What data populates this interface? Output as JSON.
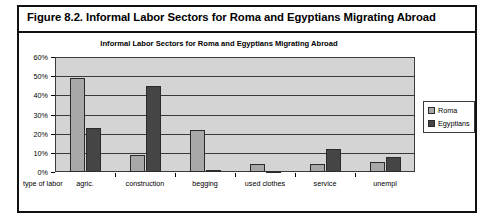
{
  "figure": {
    "caption": "Figure 8.2.  Informal Labor Sectors for Roma and Egyptians Migrating Abroad"
  },
  "chart_data": {
    "type": "bar",
    "title": "Informal Labor Sectors for Roma and Egyptians Migrating Abroad",
    "xlabel": "type of labor",
    "ylabel": "",
    "categories": [
      "agric.",
      "construction",
      "begging",
      "used clothes",
      "service",
      "unempl"
    ],
    "series": [
      {
        "name": "Roma",
        "color": "#a8a8a8",
        "values": [
          49,
          9,
          22,
          4,
          4,
          5
        ]
      },
      {
        "name": "Egyptians",
        "color": "#454545",
        "values": [
          23,
          45,
          1,
          0,
          12,
          8
        ]
      }
    ],
    "ylim": [
      0,
      60
    ],
    "yticks": [
      "0%",
      "10%",
      "20%",
      "30%",
      "40%",
      "50%",
      "60%"
    ],
    "ytick_values": [
      0,
      10,
      20,
      30,
      40,
      50,
      60
    ],
    "grid": true,
    "legend_position": "right",
    "legend": [
      "Roma",
      "Egyptians"
    ]
  }
}
